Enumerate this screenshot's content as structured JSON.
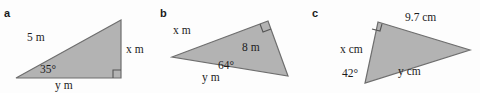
{
  "page": {
    "background_color": "#fdfdfd",
    "triangle_fill": "#b3b3b3",
    "triangle_stroke": "#6e6e6e",
    "text_color": "#1c1c1c"
  },
  "figures": [
    {
      "id": "a",
      "part_label": "a",
      "unit": "m",
      "right_angle_marked": true,
      "labels": {
        "hypotenuse": "5 m",
        "opposite": "x m",
        "adjacent": "y m",
        "angle": "35°"
      },
      "geometry": {
        "vertices": [
          [
            16,
            78
          ],
          [
            121,
            78
          ],
          [
            121,
            20
          ]
        ],
        "right_angle_vertex": [
          121,
          78
        ]
      }
    },
    {
      "id": "b",
      "part_label": "b",
      "unit": "m",
      "right_angle_marked": true,
      "labels": {
        "long_side": "x m",
        "short_side": "8 m",
        "base": "y m",
        "angle": "64°"
      },
      "geometry": {
        "vertices": [
          [
            22,
            57
          ],
          [
            118,
            21
          ],
          [
            138,
            76
          ]
        ],
        "right_angle_vertex": [
          118,
          21
        ]
      }
    },
    {
      "id": "c",
      "part_label": "c",
      "unit": "cm",
      "right_angle_marked": true,
      "labels": {
        "top_side": "9.7 cm",
        "left_side": "x cm",
        "base": "y cm",
        "angle": "42°"
      },
      "geometry": {
        "vertices": [
          [
            80,
            22
          ],
          [
            172,
            50
          ],
          [
            67,
            83
          ]
        ],
        "right_angle_vertex": [
          80,
          22
        ]
      }
    }
  ]
}
